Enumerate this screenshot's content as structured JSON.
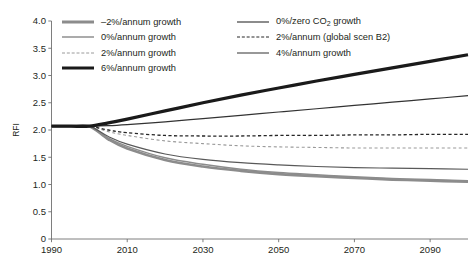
{
  "chart_data": {
    "type": "line",
    "title": "",
    "xlabel": "",
    "ylabel": "RFI",
    "xlim": [
      1990,
      2100
    ],
    "ylim": [
      0,
      4.0
    ],
    "grid": false,
    "legend_position": "top-left-inside",
    "xticks": [
      "1990",
      "2010",
      "2030",
      "2050",
      "2070",
      "2090"
    ],
    "xtick_values": [
      1990,
      2010,
      2030,
      2050,
      2070,
      2090
    ],
    "yticks": [
      "0",
      "0.5",
      "1.0",
      "1.5",
      "2.0",
      "2.5",
      "3.0",
      "3.5",
      "4.0"
    ],
    "ytick_values": [
      0,
      0.5,
      1.0,
      1.5,
      2.0,
      2.5,
      3.0,
      3.5,
      4.0
    ],
    "x": [
      1990,
      1995,
      2000,
      2005,
      2010,
      2020,
      2030,
      2040,
      2050,
      2060,
      2070,
      2080,
      2090,
      2100
    ],
    "series": [
      {
        "name": "-2%/annum growth",
        "label": "–2%/annum growth",
        "color": "#8c8c8c",
        "width": 2.6,
        "dash": "none",
        "values": [
          2.07,
          2.07,
          2.07,
          1.83,
          1.66,
          1.45,
          1.33,
          1.25,
          1.19,
          1.15,
          1.12,
          1.09,
          1.07,
          1.05
        ]
      },
      {
        "name": "0%/annum growth",
        "label": "0%/annum growth",
        "color": "#595959",
        "width": 1.2,
        "dash": "none",
        "values": [
          2.07,
          2.07,
          2.07,
          1.88,
          1.74,
          1.56,
          1.46,
          1.4,
          1.36,
          1.33,
          1.31,
          1.3,
          1.29,
          1.28
        ]
      },
      {
        "name": "2%/annum growth",
        "label": "2%/annum growth",
        "color": "#9a9a9a",
        "width": 1.1,
        "dash": "3,2.6",
        "values": [
          2.07,
          2.07,
          2.07,
          1.97,
          1.9,
          1.8,
          1.75,
          1.71,
          1.69,
          1.68,
          1.67,
          1.67,
          1.67,
          1.67
        ]
      },
      {
        "name": "6%/annum growth",
        "label": "6%/annum growth",
        "color": "#1a1a1a",
        "width": 3.2,
        "dash": "none",
        "values": [
          2.07,
          2.07,
          2.07,
          2.13,
          2.2,
          2.35,
          2.5,
          2.64,
          2.77,
          2.9,
          3.02,
          3.14,
          3.26,
          3.38
        ]
      },
      {
        "name": "0%/zero CO2 growth",
        "label": "0%/zero CO₂ growth",
        "color": "#8c8c8c",
        "width": 1.5,
        "dash": "none",
        "values": [
          2.07,
          2.07,
          2.07,
          1.85,
          1.7,
          1.49,
          1.37,
          1.28,
          1.22,
          1.18,
          1.14,
          1.11,
          1.09,
          1.07
        ]
      },
      {
        "name": "2%/annum (global scen B2)",
        "label": "2%/annum (global scen B2)",
        "color": "#262626",
        "width": 1.3,
        "dash": "3.2,2.4",
        "values": [
          2.07,
          2.07,
          2.07,
          2.0,
          1.95,
          1.9,
          1.89,
          1.89,
          1.9,
          1.9,
          1.91,
          1.91,
          1.92,
          1.92
        ]
      },
      {
        "name": "4%/annum growth",
        "label": "4%/annum growth",
        "color": "#333333",
        "width": 1.2,
        "dash": "none",
        "values": [
          2.07,
          2.07,
          2.07,
          2.08,
          2.1,
          2.15,
          2.21,
          2.27,
          2.33,
          2.39,
          2.45,
          2.51,
          2.57,
          2.63
        ]
      }
    ]
  },
  "legend": {
    "left_column": [
      {
        "label": "–2%/annum growth",
        "series": "-2%/annum growth"
      },
      {
        "label": "0%/annum growth",
        "series": "0%/annum growth"
      },
      {
        "label": "2%/annum growth",
        "series": "2%/annum growth"
      },
      {
        "label": "6%/annum growth",
        "series": "6%/annum growth"
      }
    ],
    "right_column": [
      {
        "label_pre": "0%/zero CO",
        "label_sub": "2",
        "label_post": " growth",
        "series": "0%/zero CO2 growth"
      },
      {
        "label_pre": "2%/annum (global scen B2)",
        "label_sub": "",
        "label_post": "",
        "series": "2%/annum (global scen B2)"
      },
      {
        "label_pre": "4%/annum growth",
        "label_sub": "",
        "label_post": "",
        "series": "4%/annum growth"
      }
    ]
  },
  "axis": {
    "y_title": "RFI",
    "axis_color": "#6f6f6f"
  }
}
